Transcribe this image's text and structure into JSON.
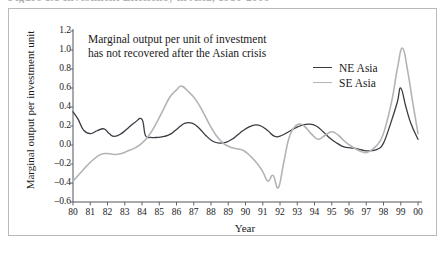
{
  "figure": {
    "caption": "Figure 1.1   Investment Efficiency in Asia, 1980-2000"
  },
  "annotation": {
    "line1": "Marginal output per unit of investment",
    "line2": "has not recovered after the Asian crisis"
  },
  "legend": {
    "position": "inside-top-right",
    "entries": [
      {
        "label": "NE Asia",
        "color": "#3b3b44"
      },
      {
        "label": "SE Asia",
        "color": "#b4b4b4"
      }
    ]
  },
  "colors": {
    "ne_asia": "#3b3b44",
    "se_asia": "#b4b4b4",
    "axis": "#55555c",
    "frame": "#b9b9bc",
    "text": "#1a1a1a"
  },
  "chart_data": {
    "type": "line",
    "title": "Figure 1.1   Investment Efficiency in Asia, 1980-2000",
    "xlabel": "Year",
    "ylabel": "Marginal output per investment unit",
    "xlim": [
      1980,
      2000
    ],
    "ylim": [
      -0.6,
      1.2
    ],
    "ytick_step": 0.2,
    "grid": false,
    "legend_position": "inside-top-right",
    "annotation": "Marginal output per unit of investment has not recovered after the Asian crisis",
    "xticklabels": [
      "80",
      "81",
      "82",
      "83",
      "84",
      "85",
      "86",
      "87",
      "88",
      "89",
      "90",
      "91",
      "92",
      "93",
      "94",
      "95",
      "96",
      "97",
      "98",
      "99",
      "00"
    ],
    "yticklabels": [
      "1.2",
      "1.0",
      "0.8",
      "0.6",
      "0.4",
      "0.2",
      "0.0",
      "-0.2",
      "-0.4",
      "-0.6"
    ],
    "x": [
      1980.0,
      1980.25,
      1980.5,
      1980.75,
      1981.0,
      1981.25,
      1981.5,
      1981.75,
      1982.0,
      1982.25,
      1982.5,
      1982.75,
      1983.0,
      1983.25,
      1983.5,
      1983.75,
      1984.0,
      1984.25,
      1984.5,
      1984.75,
      1985.0,
      1985.25,
      1985.5,
      1985.75,
      1986.0,
      1986.25,
      1986.5,
      1986.75,
      1987.0,
      1987.25,
      1987.5,
      1987.75,
      1988.0,
      1988.25,
      1988.5,
      1988.75,
      1989.0,
      1989.25,
      1989.5,
      1989.75,
      1990.0,
      1990.25,
      1990.5,
      1990.75,
      1991.0,
      1991.25,
      1991.5,
      1991.75,
      1992.0,
      1992.25,
      1992.5,
      1992.75,
      1993.0,
      1993.25,
      1993.5,
      1993.75,
      1994.0,
      1994.25,
      1994.5,
      1994.75,
      1995.0,
      1995.25,
      1995.5,
      1995.75,
      1996.0,
      1996.25,
      1996.5,
      1996.75,
      1997.0,
      1997.25,
      1997.5,
      1997.75,
      1998.0,
      1998.25,
      1998.5,
      1998.75,
      1999.0,
      1999.25,
      1999.5,
      1999.75,
      2000.0
    ],
    "series": [
      {
        "name": "NE Asia",
        "color": "#3b3b44",
        "values": [
          0.35,
          0.3,
          0.21,
          0.16,
          0.14,
          0.13,
          0.15,
          0.17,
          0.19,
          0.17,
          0.12,
          0.13,
          0.17,
          0.21,
          0.25,
          0.25,
          0.2,
          0.13,
          0.09,
          0.08,
          0.09,
          0.1,
          0.1,
          0.11,
          0.15,
          0.2,
          0.24,
          0.24,
          0.22,
          0.21,
          0.22,
          0.23,
          0.21,
          0.18,
          0.13,
          0.11,
          0.12,
          0.16,
          0.2,
          0.23,
          0.24,
          0.23,
          0.21,
          0.17,
          0.09,
          0.0,
          -0.06,
          -0.09,
          -0.1,
          -0.11,
          -0.11,
          -0.1,
          -0.09,
          -0.1,
          -0.12,
          -0.14,
          -0.13,
          -0.1,
          -0.08,
          -0.09,
          -0.13,
          -0.15,
          -0.12,
          -0.08,
          -0.09,
          -0.11,
          -0.09,
          -0.06,
          -0.05,
          -0.07,
          -0.1,
          -0.12,
          -0.1,
          -0.04,
          0.03,
          0.04,
          0.02,
          -0.02,
          -0.06,
          -0.08,
          -0.1
        ]
      }
    ],
    "series_full": [
      {
        "name": "NE Asia",
        "color": "#3b3b44",
        "points": [
          [
            1980.0,
            0.35
          ],
          [
            1980.3,
            0.27
          ],
          [
            1980.6,
            0.16
          ],
          [
            1981.0,
            0.12
          ],
          [
            1981.4,
            0.15
          ],
          [
            1981.8,
            0.17
          ],
          [
            1982.1,
            0.12
          ],
          [
            1982.4,
            0.09
          ],
          [
            1982.8,
            0.12
          ],
          [
            1983.2,
            0.18
          ],
          [
            1983.6,
            0.24
          ],
          [
            1984.0,
            0.27
          ],
          [
            1984.2,
            0.1
          ],
          [
            1984.5,
            0.08
          ],
          [
            1984.9,
            0.08
          ],
          [
            1985.3,
            0.09
          ],
          [
            1985.7,
            0.12
          ],
          [
            1986.1,
            0.18
          ],
          [
            1986.5,
            0.23
          ],
          [
            1986.9,
            0.23
          ],
          [
            1987.3,
            0.18
          ],
          [
            1987.7,
            0.1
          ],
          [
            1988.1,
            0.04
          ],
          [
            1988.5,
            0.02
          ],
          [
            1988.9,
            0.03
          ],
          [
            1989.3,
            0.07
          ],
          [
            1989.7,
            0.13
          ],
          [
            1990.1,
            0.18
          ],
          [
            1990.5,
            0.21
          ],
          [
            1990.9,
            0.2
          ],
          [
            1991.3,
            0.15
          ],
          [
            1991.7,
            0.09
          ],
          [
            1992.1,
            0.1
          ],
          [
            1992.5,
            0.14
          ],
          [
            1992.9,
            0.18
          ],
          [
            1993.3,
            0.21
          ],
          [
            1993.7,
            0.22
          ],
          [
            1994.1,
            0.2
          ],
          [
            1994.5,
            0.14
          ],
          [
            1994.9,
            0.07
          ],
          [
            1995.3,
            0.02
          ],
          [
            1995.7,
            -0.02
          ],
          [
            1996.1,
            -0.03
          ],
          [
            1996.5,
            -0.04
          ],
          [
            1996.9,
            -0.06
          ],
          [
            1997.3,
            -0.06
          ],
          [
            1997.7,
            -0.04
          ],
          [
            1998.0,
            0.02
          ],
          [
            1998.4,
            0.22
          ],
          [
            1998.8,
            0.45
          ],
          [
            1999.0,
            0.6
          ],
          [
            1999.3,
            0.4
          ],
          [
            1999.6,
            0.22
          ],
          [
            2000.0,
            0.06
          ]
        ]
      },
      {
        "name": "SE Asia",
        "color": "#b4b4b4",
        "points": [
          [
            1980.0,
            -0.38
          ],
          [
            1980.4,
            -0.3
          ],
          [
            1980.8,
            -0.22
          ],
          [
            1981.2,
            -0.15
          ],
          [
            1981.6,
            -0.1
          ],
          [
            1982.0,
            -0.09
          ],
          [
            1982.4,
            -0.1
          ],
          [
            1982.8,
            -0.09
          ],
          [
            1983.2,
            -0.06
          ],
          [
            1983.6,
            -0.03
          ],
          [
            1984.0,
            0.02
          ],
          [
            1984.4,
            0.1
          ],
          [
            1984.8,
            0.22
          ],
          [
            1985.2,
            0.36
          ],
          [
            1985.6,
            0.5
          ],
          [
            1986.0,
            0.58
          ],
          [
            1986.3,
            0.62
          ],
          [
            1986.7,
            0.56
          ],
          [
            1987.1,
            0.48
          ],
          [
            1987.5,
            0.36
          ],
          [
            1987.9,
            0.22
          ],
          [
            1988.3,
            0.1
          ],
          [
            1988.7,
            0.02
          ],
          [
            1989.1,
            -0.02
          ],
          [
            1989.5,
            -0.04
          ],
          [
            1989.9,
            -0.06
          ],
          [
            1990.3,
            -0.12
          ],
          [
            1990.7,
            -0.2
          ],
          [
            1991.0,
            -0.28
          ],
          [
            1991.3,
            -0.38
          ],
          [
            1991.6,
            -0.32
          ],
          [
            1991.9,
            -0.45
          ],
          [
            1992.2,
            -0.2
          ],
          [
            1992.5,
            0.06
          ],
          [
            1992.8,
            0.18
          ],
          [
            1993.1,
            0.22
          ],
          [
            1993.4,
            0.2
          ],
          [
            1993.8,
            0.12
          ],
          [
            1994.2,
            0.06
          ],
          [
            1994.6,
            0.1
          ],
          [
            1995.0,
            0.14
          ],
          [
            1995.4,
            0.1
          ],
          [
            1995.8,
            0.03
          ],
          [
            1996.2,
            -0.02
          ],
          [
            1996.6,
            -0.06
          ],
          [
            1997.0,
            -0.08
          ],
          [
            1997.4,
            -0.04
          ],
          [
            1997.8,
            0.04
          ],
          [
            1998.1,
            0.18
          ],
          [
            1998.5,
            0.48
          ],
          [
            1998.8,
            0.8
          ],
          [
            1999.1,
            1.02
          ],
          [
            1999.4,
            0.78
          ],
          [
            1999.7,
            0.44
          ],
          [
            2000.0,
            0.12
          ]
        ]
      }
    ]
  }
}
